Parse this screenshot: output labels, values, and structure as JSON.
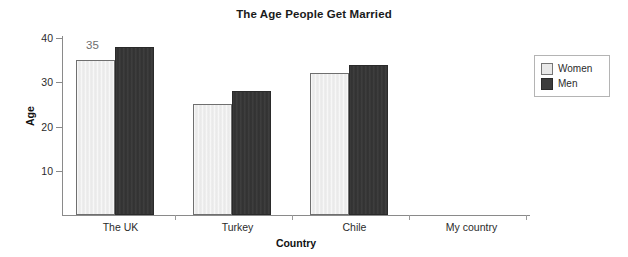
{
  "chart_data": {
    "type": "bar",
    "title": "The Age People Get Married",
    "xlabel": "Country",
    "ylabel": "Age",
    "categories": [
      "The UK",
      "Turkey",
      "Chile",
      "My country"
    ],
    "series": [
      {
        "name": "Women",
        "color": "#e9e9e9",
        "values": [
          35,
          25,
          32,
          null
        ]
      },
      {
        "name": "Men",
        "color": "#3c3c3c",
        "values": [
          38,
          28,
          34,
          null
        ]
      }
    ],
    "ylim": [
      0,
      40
    ],
    "yticks": [
      10,
      20,
      30,
      40
    ],
    "ytick_labels": [
      "10",
      "20",
      "30",
      "40"
    ],
    "grid": false,
    "legend_position": "right",
    "annotations": [
      {
        "text": "35",
        "series": "Women",
        "category": "The UK",
        "value": 35
      }
    ]
  },
  "legend": {
    "items": [
      {
        "label": "Women",
        "swatch": "legend-swatch-women"
      },
      {
        "label": "Men",
        "swatch": "legend-swatch-men"
      }
    ]
  }
}
